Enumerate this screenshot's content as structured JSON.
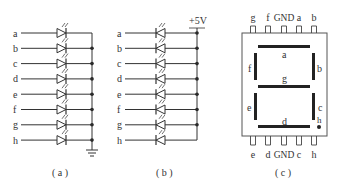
{
  "panel_a": {
    "caption": "( a )",
    "rows": [
      "a",
      "b",
      "c",
      "d",
      "e",
      "f",
      "g",
      "h"
    ],
    "common": "ground"
  },
  "panel_b": {
    "caption": "( b )",
    "rows": [
      "a",
      "b",
      "c",
      "d",
      "e",
      "f",
      "g",
      "h"
    ],
    "supply_label": "+5V"
  },
  "panel_c": {
    "caption": "( c )",
    "top_pins": [
      "g",
      "f",
      "GND",
      "a",
      "b"
    ],
    "bottom_pins": [
      "e",
      "d",
      "GND",
      "c",
      "h"
    ],
    "segments": {
      "a": "a",
      "b": "b",
      "c": "c",
      "d": "d",
      "e": "e",
      "f": "f",
      "g": "g",
      "h": "h"
    }
  },
  "colors": {
    "line": "#333333",
    "segment": "#222222",
    "background": "#ffffff"
  }
}
